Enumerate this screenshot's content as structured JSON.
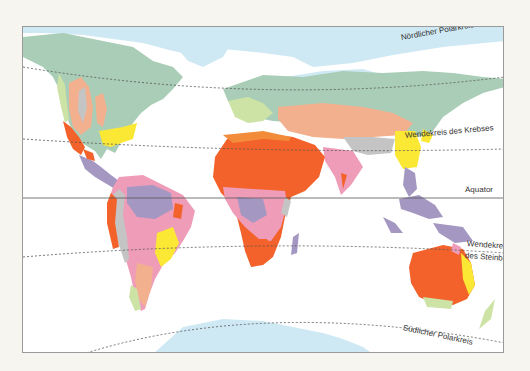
{
  "map": {
    "labels": {
      "arctic_circle": "Nördlicher Polarkreis",
      "tropic_cancer": "Wendekreis des Krebses",
      "equator": "Äquator",
      "tropic_capricorn_1": "Wendekreis",
      "tropic_capricorn_2": "des Steinbocks",
      "antarctic_circle": "Südlicher Polarkreis"
    },
    "colors": {
      "ice": "#cfe9f4",
      "tundra_boreal": "#a9cdb6",
      "temperate": "#cde3a5",
      "steppe": "#f3b08f",
      "desert": "#f2622a",
      "savanna_dry": "#f28c3a",
      "subtropical_humid": "#fbe835",
      "savanna": "#ef9cb9",
      "tropical_rainforest": "#a497c2",
      "mountain": "#c4c4c4",
      "ocean": "#ffffff"
    }
  }
}
